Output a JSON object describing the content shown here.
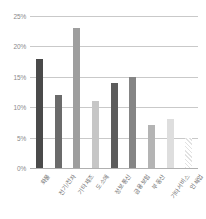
{
  "chart_data": {
    "type": "bar",
    "title": "",
    "subtitle": "",
    "xlabel": "",
    "ylabel": "",
    "ylim": [
      0,
      25
    ],
    "ytick_labels": [
      "0%",
      "5%",
      "10%",
      "15%",
      "20%",
      "25%"
    ],
    "ytick_values": [
      0,
      5,
      10,
      15,
      20,
      25
    ],
    "grid": true,
    "legend": "none",
    "value_unit": "%",
    "categories": [
      "화물",
      "전기/전자",
      "기타제조",
      "도소매",
      "정보통신",
      "금융보험",
      "부동산",
      "기타서비스",
      "인쇄업"
    ],
    "values": [
      18,
      12,
      23,
      11,
      14,
      15,
      7,
      8,
      5
    ],
    "bar_colors": [
      "#4a4a4a",
      "#6b6b6b",
      "#9e9e9e",
      "#c6c6c6",
      "#5c5c5c",
      "#858585",
      "#b4b4b4",
      "#dedede",
      "#ededed"
    ],
    "bar_patterns": [
      "solid",
      "solid",
      "solid",
      "solid",
      "solid",
      "solid",
      "solid",
      "solid",
      "hatched"
    ]
  }
}
